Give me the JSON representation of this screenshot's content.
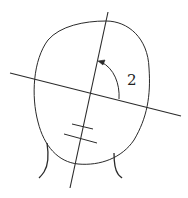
{
  "diagram": {
    "annotation_label": "2",
    "stroke_color": "#2a2a2a",
    "background_color": "#ffffff"
  }
}
